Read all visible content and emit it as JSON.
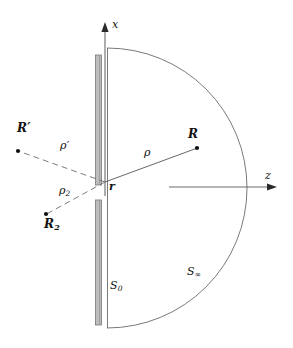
{
  "figure": {
    "width": 293,
    "height": 348,
    "background": "#ffffff",
    "ink": "#3a3a3a",
    "barrier_fill": "#b9b9b9",
    "barrier_stroke": "#6e6e6e"
  },
  "axes": {
    "x_axis": {
      "label": "x",
      "from": [
        105,
        182
      ],
      "to": [
        105,
        24
      ],
      "arrow": "up"
    },
    "z_axis": {
      "label": "z",
      "from": [
        170,
        187
      ],
      "to": [
        277,
        187
      ],
      "arrow": "right"
    }
  },
  "origin": {
    "label": "r",
    "point": [
      105,
      182
    ],
    "description": "aperture point on the screen"
  },
  "points": [
    {
      "name": "R",
      "label": "R",
      "bold": true,
      "x": 197,
      "y": 148,
      "side": "right"
    },
    {
      "name": "R_prime",
      "label": "R",
      "prime": "′",
      "bold": true,
      "x": 18,
      "y": 151,
      "side": "left"
    },
    {
      "name": "R_2",
      "label": "R",
      "subscript": "2",
      "bold": true,
      "x": 46,
      "y": 214,
      "side": "left"
    }
  ],
  "rays": [
    {
      "name": "rho",
      "label": "ρ",
      "style": "solid",
      "from": [
        105,
        182
      ],
      "to": [
        197,
        148
      ],
      "description": "solid ray from r to R"
    },
    {
      "name": "rho_prime",
      "label": "ρ",
      "prime": "′",
      "style": "dashed",
      "from": [
        105,
        182
      ],
      "to": [
        18,
        151
      ],
      "description": "dashed ray from r to R-prime"
    },
    {
      "name": "rho_2",
      "label": "ρ",
      "subscript": "2",
      "style": "dashed",
      "from": [
        105,
        182
      ],
      "to": [
        46,
        214
      ],
      "description": "dashed ray from r to R-2"
    }
  ],
  "surfaces": [
    {
      "name": "S_0",
      "label": "S",
      "subscript": "0",
      "description": "planar aperture screen surface"
    },
    {
      "name": "S_infinity",
      "label": "S",
      "subscript": "∞",
      "description": "hemispherical surface at infinity"
    }
  ],
  "screen": {
    "upper_segment": {
      "x": 96,
      "y": 55,
      "width": 6,
      "height": 130
    },
    "lower_segment": {
      "x": 96,
      "y": 200,
      "width": 6,
      "height": 125
    },
    "plane_line": {
      "x": 107,
      "y_top": 48,
      "y_bottom": 328
    }
  },
  "hemisphere": {
    "center": [
      107,
      188
    ],
    "radius": 140,
    "opens": "right"
  }
}
